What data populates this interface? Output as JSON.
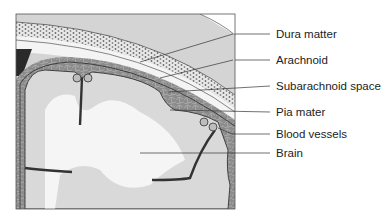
{
  "labels": [
    {
      "id": "dura",
      "text": "Dura matter",
      "y": 34,
      "pointer": [
        140,
        62
      ]
    },
    {
      "id": "arachnoid",
      "text": "Arachnoid",
      "y": 60,
      "pointer": [
        160,
        78
      ]
    },
    {
      "id": "subarachnoid",
      "text": "Subarachnoid space",
      "y": 86,
      "pointer": [
        168,
        92
      ]
    },
    {
      "id": "pia",
      "text": "Pia mater",
      "y": 112,
      "pointer": [
        170,
        110
      ]
    },
    {
      "id": "vessels",
      "text": "Blood vessels",
      "y": 134,
      "pointer": [
        220,
        130
      ]
    },
    {
      "id": "brain",
      "text": "Brain",
      "y": 153,
      "pointer": [
        140,
        153
      ]
    }
  ],
  "colors": {
    "bone": "#cfcfcf",
    "dura": "#f2f2f2",
    "arachnoid_tissue": "#8e8e8e",
    "brain_gray": "#dcdcdc",
    "brain_white": "#f4f4f4",
    "outline": "#3a3a3a",
    "dark_block": "#2a2a2a"
  }
}
